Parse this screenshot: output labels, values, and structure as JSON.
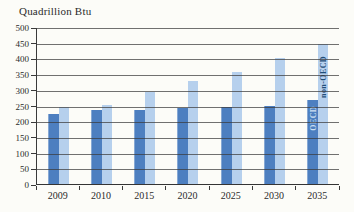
{
  "chart_data": {
    "type": "bar",
    "title": "Quadrillion Btu",
    "categories": [
      "2009",
      "2010",
      "2015",
      "2020",
      "2025",
      "2030",
      "2035"
    ],
    "series": [
      {
        "name": "OECD",
        "color": "#4d7fc0",
        "label_color": "#cfe0f2",
        "values": [
          225,
          240,
          240,
          245,
          250,
          252,
          270
        ]
      },
      {
        "name": "non-OECD",
        "color": "#b6d0ed",
        "label_color": "#1f4e79",
        "values": [
          250,
          255,
          295,
          330,
          360,
          405,
          450
        ]
      }
    ],
    "yticks": [
      "500",
      "450",
      "400",
      "350",
      "300",
      "250",
      "200",
      "150",
      "100",
      "50",
      "0"
    ],
    "ylim": [
      0,
      500
    ],
    "ytick_step": 50,
    "grid": true,
    "legend_position": "inside-last-bars",
    "labeled_category": "2035",
    "colors": {
      "gridline": "#3a3a3a",
      "axis": "#3a3a3a",
      "text": "#2b2b2b",
      "background": "#fcfcf8"
    }
  }
}
